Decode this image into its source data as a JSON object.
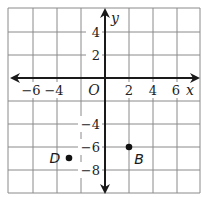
{
  "diagram": {
    "type": "coordinate-plane",
    "axes": {
      "x_label": "x",
      "y_label": "y",
      "origin_label": "O",
      "x_range": [
        -8,
        8
      ],
      "y_range": [
        -10,
        6
      ],
      "grid_spacing": 2,
      "x_ticks": [
        {
          "value": -6,
          "label": "−6"
        },
        {
          "value": -4,
          "label": "−4"
        },
        {
          "value": 2,
          "label": "2"
        },
        {
          "value": 4,
          "label": "4"
        },
        {
          "value": 6,
          "label": "6"
        }
      ],
      "y_ticks": [
        {
          "value": 4,
          "label": "4"
        },
        {
          "value": 2,
          "label": "2"
        },
        {
          "value": -4,
          "label": "−4"
        },
        {
          "value": -6,
          "label": "−6"
        },
        {
          "value": -8,
          "label": "−8"
        }
      ]
    },
    "points": [
      {
        "name": "D",
        "x": -3,
        "y": -7
      },
      {
        "name": "B",
        "x": 2,
        "y": -6
      }
    ],
    "colors": {
      "grid": "#8a8a8a",
      "axis": "#1a1a1a",
      "point": "#111111",
      "background": "#ffffff"
    }
  }
}
